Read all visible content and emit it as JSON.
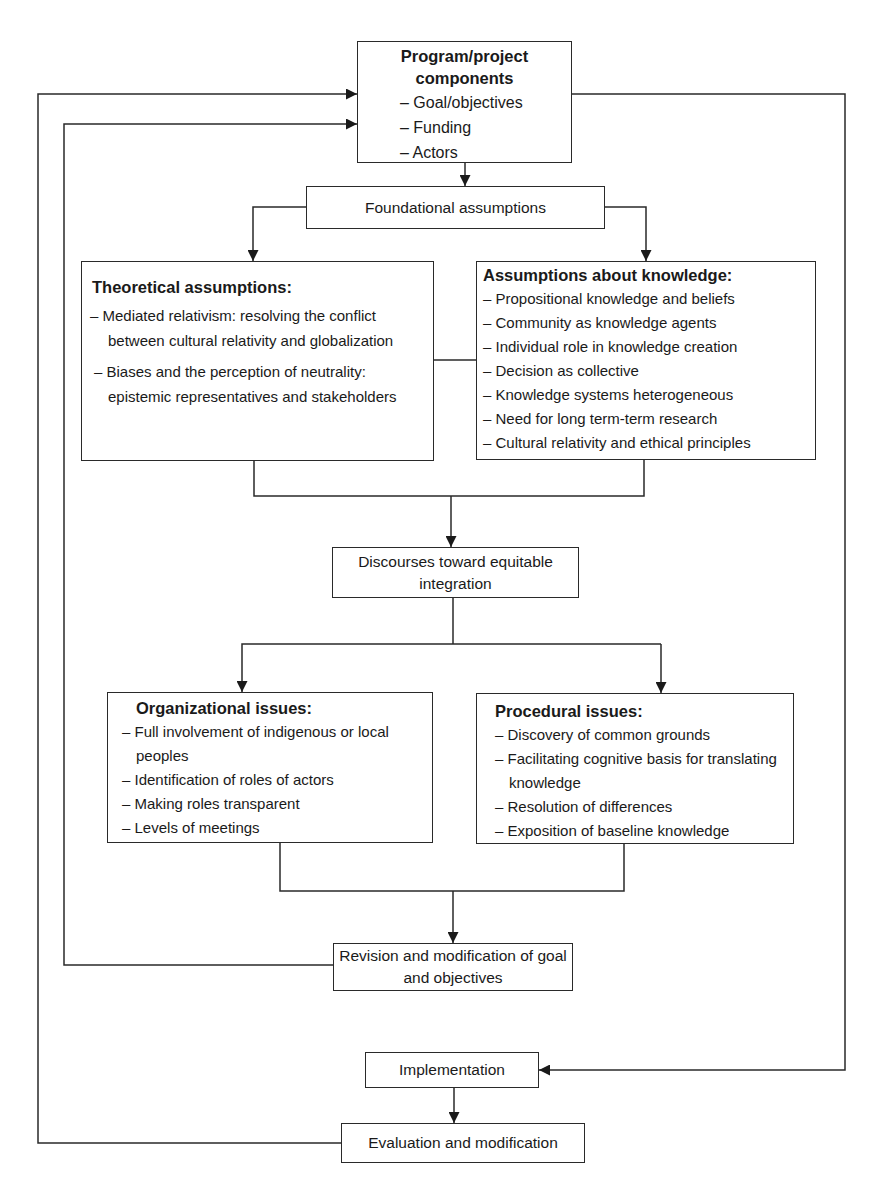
{
  "diagram": {
    "type": "flowchart",
    "nodes": {
      "program": {
        "title": "Program/project components",
        "title_line1": "Program/project",
        "title_line2": "components",
        "items": [
          "Goal/objectives",
          "Funding",
          "Actors"
        ]
      },
      "foundational": {
        "label": "Foundational assumptions"
      },
      "theoretical": {
        "title": "Theoretical assumptions:",
        "items": [
          "Mediated relativism: resolving the conflict between cultural relativity and globalization",
          "Biases and the perception of neutrality: epistemic representatives and stakeholders"
        ]
      },
      "knowledge": {
        "title": "Assumptions about knowledge:",
        "items": [
          "Propositional knowledge and beliefs",
          "Community as knowledge agents",
          "Individual role in knowledge creation",
          "Decision as collective",
          "Knowledge systems heterogeneous",
          "Need for long term-term research",
          "Cultural relativity and ethical principles"
        ]
      },
      "discourses": {
        "label": "Discourses toward equitable integration"
      },
      "organizational": {
        "title": "Organizational issues:",
        "items": [
          "Full involvement of indigenous or local peoples",
          "Identification of roles of actors",
          "Making roles transparent",
          "Levels of meetings"
        ]
      },
      "procedural": {
        "title": "Procedural issues:",
        "items": [
          "Discovery of common grounds",
          "Facilitating cognitive basis for translating knowledge",
          "Resolution of differences",
          "Exposition of baseline knowledge"
        ]
      },
      "revision": {
        "label": "Revision and modification of goal and objectives"
      },
      "implementation": {
        "label": "Implementation"
      },
      "evaluation": {
        "label": "Evaluation and modification"
      }
    },
    "edges": [
      {
        "from": "program",
        "to": "foundational"
      },
      {
        "from": "foundational",
        "to": "theoretical"
      },
      {
        "from": "foundational",
        "to": "knowledge"
      },
      {
        "from": "theoretical",
        "to": "knowledge",
        "style": "line"
      },
      {
        "from": "theoretical",
        "to": "discourses"
      },
      {
        "from": "knowledge",
        "to": "discourses"
      },
      {
        "from": "discourses",
        "to": "organizational"
      },
      {
        "from": "discourses",
        "to": "procedural"
      },
      {
        "from": "organizational",
        "to": "revision"
      },
      {
        "from": "procedural",
        "to": "revision"
      },
      {
        "from": "revision",
        "to": "program"
      },
      {
        "from": "program",
        "to": "implementation"
      },
      {
        "from": "implementation",
        "to": "evaluation"
      },
      {
        "from": "evaluation",
        "to": "program"
      }
    ],
    "colors": {
      "line": "#2a2a2a",
      "box_fill": "#ffffff",
      "text": "#1a1a1a"
    }
  }
}
